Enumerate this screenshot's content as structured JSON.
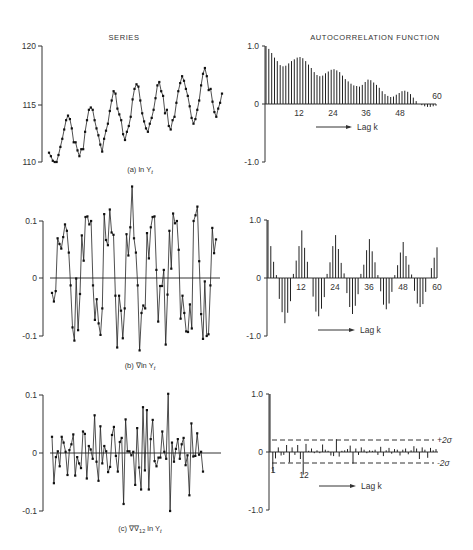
{
  "titles": {
    "series": "SERIES",
    "acf": "AUTOCORRELATION FUNCTION"
  },
  "lag_label": "Lag k",
  "panels": [
    {
      "id": "a",
      "caption": "(a)  ln Y",
      "caption_sub": "t",
      "series_ticks": [
        "120",
        "115",
        "110"
      ],
      "acf_ticks": [
        "1.0",
        "0",
        "-1.0"
      ],
      "acf_lag_ticks": [
        "12",
        "24",
        "36",
        "48",
        "60"
      ]
    },
    {
      "id": "b",
      "caption": "(b)  ∇ln Y",
      "caption_sub": "t",
      "series_ticks": [
        "0.1",
        "0",
        "-0.1"
      ],
      "acf_ticks": [
        "1.0",
        "0",
        "-1.0"
      ],
      "acf_lag_ticks": [
        "12",
        "24",
        "36",
        "48",
        "60"
      ]
    },
    {
      "id": "c",
      "caption": "(c)  ∇∇",
      "caption_mid": "12",
      "caption_tail": " ln Y",
      "caption_sub": "t",
      "series_ticks": [
        "0.1",
        "0",
        "-0.1"
      ],
      "acf_ticks": [
        "1.0",
        "0",
        "-1.0"
      ],
      "acf_lag_ticks": [
        "1",
        "12"
      ],
      "sigma_labels": [
        "+2σ",
        "-2σ"
      ]
    }
  ],
  "chart_data": [
    {
      "type": "line",
      "title": "SERIES",
      "panel": "(a) ln Yt",
      "ylim": [
        110,
        120
      ],
      "yticks": [
        110,
        115,
        120
      ],
      "values": [
        110.8,
        110.5,
        110.1,
        110.0,
        110.0,
        110.6,
        111.3,
        112.0,
        112.8,
        113.6,
        114.0,
        113.7,
        112.9,
        111.7,
        111.7,
        111.0,
        110.5,
        111.1,
        111.1,
        112.6,
        113.6,
        114.5,
        114.7,
        114.5,
        113.6,
        112.9,
        112.3,
        111.5,
        110.9,
        112.0,
        112.7,
        113.3,
        114.4,
        115.3,
        116.1,
        115.9,
        114.6,
        114.1,
        113.6,
        112.4,
        111.9,
        112.6,
        113.1,
        113.9,
        115.4,
        116.3,
        116.7,
        116.5,
        115.3,
        114.2,
        113.5,
        112.9,
        112.6,
        113.3,
        113.8,
        114.5,
        115.5,
        116.6,
        116.9,
        116.1,
        115.7,
        114.2,
        114.5,
        113.1,
        112.8,
        113.6,
        113.9,
        115.1,
        116.1,
        116.8,
        117.4,
        117.0,
        116.3,
        115.7,
        114.8,
        113.8,
        113.3,
        113.7,
        114.5,
        115.3,
        116.6,
        117.6,
        118.1,
        117.4,
        116.2,
        116.3,
        115.2,
        114.3,
        113.9,
        114.6,
        115.1,
        115.9
      ]
    },
    {
      "type": "bar",
      "title": "AUTOCORRELATION FUNCTION",
      "panel": "(a)",
      "xlabel": "Lag k",
      "ylim": [
        -1.0,
        1.0
      ],
      "xlim": [
        0,
        60
      ],
      "xticks": [
        12,
        24,
        36,
        48,
        60
      ],
      "values": [
        1.0,
        0.95,
        0.88,
        0.8,
        0.74,
        0.67,
        0.65,
        0.66,
        0.7,
        0.74,
        0.77,
        0.8,
        0.81,
        0.79,
        0.74,
        0.68,
        0.62,
        0.55,
        0.5,
        0.48,
        0.49,
        0.53,
        0.56,
        0.59,
        0.6,
        0.58,
        0.55,
        0.49,
        0.43,
        0.39,
        0.35,
        0.32,
        0.31,
        0.3,
        0.33,
        0.38,
        0.42,
        0.41,
        0.37,
        0.33,
        0.28,
        0.22,
        0.17,
        0.14,
        0.12,
        0.13,
        0.16,
        0.19,
        0.22,
        0.23,
        0.21,
        0.17,
        0.11,
        0.05,
        0.0,
        -0.02,
        -0.04,
        -0.05,
        -0.05,
        -0.04,
        -0.03
      ]
    },
    {
      "type": "line",
      "title": "SERIES",
      "panel": "(b) ∇ln Yt",
      "ylim": [
        -0.1,
        0.1
      ],
      "yticks": [
        -0.1,
        0,
        0.1
      ],
      "values": [
        -0.025,
        -0.04,
        -0.022,
        0.07,
        0.06,
        0.052,
        0.072,
        0.094,
        0.083,
        0.045,
        -0.012,
        -0.085,
        -0.108,
        0.0,
        -0.09,
        -0.027,
        0.075,
        0.031,
        0.107,
        0.108,
        0.094,
        0.1,
        -0.012,
        -0.072,
        -0.036,
        -0.078,
        -0.098,
        -0.052,
        0.112,
        0.067,
        0.058,
        0.12,
        0.08,
        0.076,
        -0.03,
        -0.12,
        -0.03,
        -0.056,
        -0.104,
        -0.052,
        0.077,
        0.04,
        0.089,
        0.16,
        0.07,
        0.045,
        -0.012,
        -0.125,
        -0.06,
        -0.047,
        -0.052,
        0.079,
        0.035,
        0.089,
        0.107,
        0.108,
        0.015,
        -0.075,
        -0.013,
        -0.013,
        0.015,
        -0.115,
        -0.028,
        0.083,
        0.017,
        0.113,
        0.096,
        0.1,
        0.05,
        -0.07,
        -0.03,
        -0.06,
        -0.092,
        -0.093,
        -0.045,
        -0.087,
        0.1,
        0.11,
        0.125,
        0.03,
        -0.062,
        -0.105,
        -0.005,
        -0.1,
        -0.097,
        -0.012,
        0.088,
        0.044,
        0.068
      ]
    },
    {
      "type": "bar",
      "title": "AUTOCORRELATION FUNCTION",
      "panel": "(b)",
      "xlabel": "Lag k",
      "ylim": [
        -1.0,
        1.0
      ],
      "xlim": [
        0,
        60
      ],
      "xticks": [
        12,
        24,
        36,
        48,
        60
      ],
      "values": [
        1.0,
        0.55,
        0.28,
        0.05,
        -0.36,
        -0.59,
        -0.78,
        -0.6,
        -0.4,
        0.07,
        0.3,
        0.55,
        0.82,
        0.52,
        0.28,
        0.0,
        -0.32,
        -0.58,
        -0.66,
        -0.53,
        -0.33,
        0.07,
        0.27,
        0.55,
        0.74,
        0.5,
        0.26,
        0.08,
        -0.26,
        -0.5,
        -0.62,
        -0.48,
        -0.28,
        0.07,
        0.23,
        0.48,
        0.67,
        0.46,
        0.27,
        0.05,
        -0.23,
        -0.46,
        -0.54,
        -0.44,
        -0.24,
        0.05,
        0.22,
        0.44,
        0.62,
        0.38,
        0.23,
        0.06,
        -0.22,
        -0.44,
        -0.5,
        -0.45,
        -0.24,
        0.0,
        0.17,
        0.35,
        0.53
      ]
    },
    {
      "type": "line",
      "title": "SERIES",
      "panel": "(c) ∇∇12 ln Yt",
      "ylim": [
        -0.1,
        0.1
      ],
      "yticks": [
        -0.1,
        0,
        0.1
      ],
      "values": [
        0.028,
        -0.052,
        -0.007,
        0.003,
        -0.023,
        0.028,
        0.018,
        0.002,
        -0.038,
        0.005,
        0.015,
        0.032,
        -0.039,
        -0.007,
        -0.018,
        -0.026,
        0.037,
        0.033,
        -0.044,
        0.012,
        0.006,
        -0.01,
        0.065,
        -0.015,
        -0.048,
        0.046,
        -0.018,
        0.012,
        0.003,
        -0.033,
        -0.024,
        0.031,
        0.045,
        -0.005,
        -0.032,
        0.019,
        0.026,
        -0.088,
        0.058,
        0.003,
        0.003,
        -0.004,
        0.002,
        -0.055,
        0.043,
        -0.025,
        -0.063,
        0.079,
        -0.03,
        0.074,
        -0.063,
        0.024,
        0.057,
        -0.014,
        -0.023,
        -0.008,
        -0.008,
        0.037,
        0.002,
        -0.01,
        0.102,
        -0.1,
        0.018,
        -0.015,
        0.007,
        0.024,
        -0.01,
        0.015,
        0.026,
        -0.021,
        -0.004,
        -0.073,
        0.051,
        -0.006,
        -0.005,
        0.034,
        -0.003,
        0.002,
        -0.032
      ]
    },
    {
      "type": "bar",
      "title": "AUTOCORRELATION FUNCTION",
      "panel": "(c)",
      "xlabel": "Lag k",
      "ylim": [
        -1.0,
        1.0
      ],
      "xlim": [
        0,
        60
      ],
      "xticks": [
        1,
        12
      ],
      "bounds": {
        "plus_2sigma": 0.2,
        "minus_2sigma": -0.2
      },
      "values": [
        1.0,
        -0.34,
        -0.11,
        0.08,
        -0.06,
        -0.05,
        0.12,
        -0.18,
        0.08,
        -0.05,
        0.12,
        -0.12,
        -0.39,
        0.14,
        0.02,
        0.06,
        -0.02,
        0.03,
        -0.02,
        0.13,
        0.04,
        0.02,
        -0.06,
        -0.07,
        0.22,
        -0.08,
        0.02,
        0.03,
        0.05,
        0.11,
        -0.2,
        0.06,
        -0.05,
        0.08,
        0.04,
        -0.02,
        0.03,
        0.02,
        0.04,
        -0.05,
        0.09,
        -0.07,
        0.03,
        0.07,
        -0.03,
        0.05,
        0.04,
        -0.06,
        0.04,
        0.06,
        -0.04,
        0.03,
        0.1,
        0.06,
        -0.12,
        0.08,
        0.04,
        -0.1,
        0.07,
        0.03,
        0.05
      ]
    }
  ]
}
